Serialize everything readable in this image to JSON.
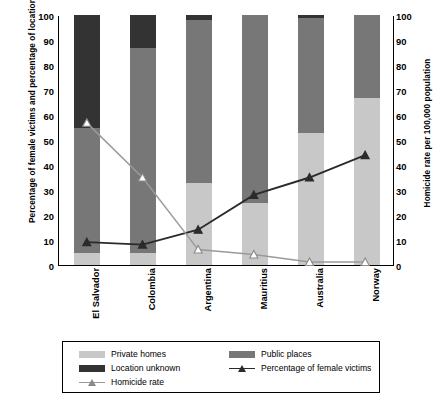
{
  "chart_data": {
    "type": "bar",
    "title": "",
    "subtitle": "",
    "categories": [
      "El Salvador",
      "Colombia",
      "Argentina",
      "Mauritius",
      "Australia",
      "Norway"
    ],
    "xlabel": "",
    "ylabel": "Percentage of female victims and percentage of location",
    "y2label": "Homicide rate per 100,000 population",
    "ylim": [
      0,
      100
    ],
    "y2lim": [
      0,
      100
    ],
    "yticks": [
      0,
      10,
      20,
      30,
      40,
      50,
      60,
      70,
      80,
      90,
      100
    ],
    "y2ticks": [
      0,
      10,
      20,
      30,
      40,
      50,
      60,
      70,
      80,
      90,
      100
    ],
    "grid": false,
    "legend_position": "bottom",
    "stacked": true,
    "series": [
      {
        "name": "Private homes",
        "kind": "bar",
        "axis": "left",
        "color": "#c8c8c8",
        "values": [
          5,
          5,
          33,
          25,
          53,
          67
        ]
      },
      {
        "name": "Public places",
        "kind": "bar",
        "axis": "left",
        "color": "#777777",
        "values": [
          50,
          82,
          65,
          75,
          46,
          33
        ]
      },
      {
        "name": "Location unknown",
        "kind": "bar",
        "axis": "left",
        "color": "#333333",
        "values": [
          45,
          13,
          2,
          0,
          1,
          0
        ]
      },
      {
        "name": "Percentage of female victims",
        "kind": "line",
        "axis": "left",
        "color": "#2b2b2b",
        "marker": "triangle-filled",
        "values": [
          9,
          8,
          14,
          28,
          35,
          44
        ]
      },
      {
        "name": "Homicide rate",
        "kind": "line",
        "axis": "right",
        "color": "#9a9a9a",
        "marker": "triangle-open",
        "values": [
          57,
          35,
          6,
          4,
          1,
          1
        ]
      }
    ]
  },
  "axes": {
    "left_title": "Percentage of female victims and percentage of location",
    "right_title": "Homicide rate per 100,000 population",
    "tick_labels": [
      "100",
      "90",
      "80",
      "70",
      "60",
      "50",
      "40",
      "30",
      "20",
      "10",
      "0"
    ]
  },
  "legend": {
    "items": [
      {
        "label": "Private homes",
        "swatch": "bar-light-gray"
      },
      {
        "label": "Public places",
        "swatch": "bar-medium-gray"
      },
      {
        "label": "Location unknown",
        "swatch": "bar-dark-gray"
      },
      {
        "label": "Percentage of female victims",
        "swatch": "line-dark-triangle"
      },
      {
        "label": "Homicide rate",
        "swatch": "line-gray-triangle"
      }
    ]
  },
  "colors": {
    "private_homes": "#c8c8c8",
    "public_places": "#777777",
    "location_unknown": "#333333",
    "female_victims_line": "#2b2b2b",
    "homicide_rate_line": "#9a9a9a",
    "axis": "#000000",
    "background": "#ffffff"
  }
}
